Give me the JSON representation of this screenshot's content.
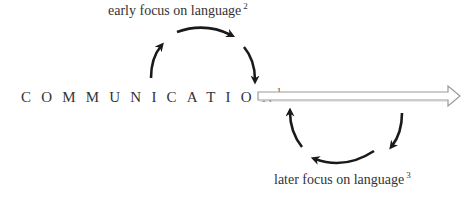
{
  "diagram": {
    "main_term": "COMMUNICATION",
    "main_footnote": "1",
    "upper_cycle_label": "early focus on language",
    "upper_footnote": "2",
    "lower_cycle_label": "later focus on language",
    "lower_footnote": "3",
    "icons": {
      "timeline_arrow": "hollow-right-arrow-icon",
      "cycle_arrows": "curved-arrow-icon"
    },
    "colors": {
      "text": "#333333",
      "arrow": "#1a1a1a",
      "timeline_outline": "#9a9a9a",
      "timeline_fill": "#ffffff"
    }
  }
}
